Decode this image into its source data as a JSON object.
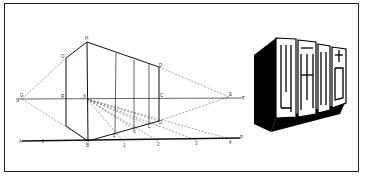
{
  "figure": {
    "perspective_diagram": {
      "labels": {
        "H": "H",
        "O": "O",
        "G": "G",
        "S": "S",
        "R": "R",
        "X": "X",
        "C": "C",
        "E": "E",
        "T": "T",
        "D_top": "D",
        "D_bottom": "D",
        "A": "A",
        "B": "B",
        "P": "P",
        "F": "F",
        "K": "K",
        "L": "L",
        "t1": "1",
        "t2": "2",
        "t3": "3",
        "t4": "4"
      },
      "colors": {
        "line": "#111111",
        "dashed": "#444444",
        "background": "#ffffff"
      }
    },
    "block_letters": {
      "text": "四面八方",
      "style": "3D extruded, black shadow on left and bottom faces"
    }
  }
}
